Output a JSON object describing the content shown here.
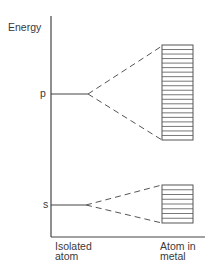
{
  "diagram": {
    "y_axis_label": "Energy",
    "levels": [
      {
        "name": "p",
        "y": 94,
        "band": {
          "top": 45,
          "bottom": 140,
          "lines": 21
        }
      },
      {
        "name": "s",
        "y": 205,
        "band": {
          "top": 185,
          "bottom": 223,
          "lines": 8
        }
      }
    ],
    "x_labels": {
      "left": [
        "Isolated",
        "atom"
      ],
      "right": [
        "Atom in",
        "metal"
      ]
    },
    "colors": {
      "line": "#444444",
      "band": "#555555"
    }
  }
}
